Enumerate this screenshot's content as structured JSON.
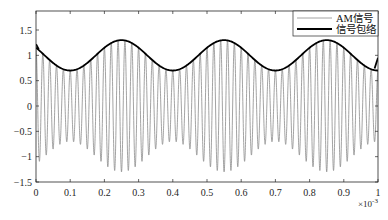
{
  "chart_data": {
    "type": "line",
    "title": "",
    "xlabel": "",
    "ylabel": "",
    "x_multiplier_label": "×10",
    "x_multiplier_exp": "-3",
    "xlim": [
      0,
      1
    ],
    "ylim": [
      -1.5,
      1.875
    ],
    "xticks": [
      0,
      0.1,
      0.2,
      0.3,
      0.4,
      0.5,
      0.6,
      0.7,
      0.8,
      0.9,
      1
    ],
    "xtick_labels": [
      "0",
      "0.1",
      "0.2",
      "0.3",
      "0.4",
      "0.5",
      "0.6",
      "0.7",
      "0.8",
      "0.9",
      "1"
    ],
    "yticks": [
      -1.5,
      -1,
      -0.5,
      0,
      0.5,
      1,
      1.5
    ],
    "ytick_labels": [
      "-1.5",
      "-1",
      "-0.5",
      "0",
      "0.5",
      "1",
      "1.5"
    ],
    "grid": false,
    "legend_position": "northeast",
    "series": [
      {
        "name": "AM信号",
        "style": "thin gray",
        "color": "#8c8c8c",
        "description": "AM waveform: carrier ~50 cycles per 1e-3 s (≈50 kHz) amplitude-modulated by envelope",
        "carrier_cycles_in_span": 50,
        "formula": "(1 + 0.3*cos(2*pi*(x-0.25)/0.3)) * cos(2*pi*50*x)"
      },
      {
        "name": "信号包络",
        "style": "thick black",
        "color": "#000000",
        "description": "Envelope: peaks ≈1.3 at x≈0.25, 0.55, 0.85; troughs ≈0.7 at x≈0.1, 0.4, 0.7, 1.0; edge artifacts at x=0 (~1.18) and x=1 (~0.8→1.0)",
        "x": [
          0,
          0.05,
          0.1,
          0.15,
          0.2,
          0.25,
          0.3,
          0.35,
          0.4,
          0.45,
          0.5,
          0.55,
          0.6,
          0.65,
          0.7,
          0.75,
          0.8,
          0.85,
          0.9,
          0.95,
          1.0
        ],
        "values": [
          1.18,
          0.85,
          0.7,
          0.85,
          1.15,
          1.3,
          1.15,
          0.85,
          0.7,
          0.85,
          1.15,
          1.3,
          1.15,
          0.85,
          0.7,
          0.85,
          1.15,
          1.3,
          1.15,
          0.85,
          0.72
        ]
      }
    ],
    "modulation": {
      "carrier_amplitude": 1,
      "modulation_index": 0.3,
      "envelope_period": 0.3,
      "envelope_peak_x": 0.25
    }
  },
  "legend": {
    "items": [
      {
        "label": "AM信号",
        "color": "#8c8c8c",
        "width": 0.8
      },
      {
        "label": "信号包络",
        "color": "#000000",
        "width": 1.8
      }
    ]
  }
}
